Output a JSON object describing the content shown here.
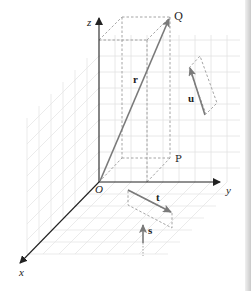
{
  "diagram": {
    "type": "3d-vector-diagram",
    "axes": {
      "x": {
        "label": "x"
      },
      "y": {
        "label": "y"
      },
      "z": {
        "label": "z"
      }
    },
    "origin": {
      "label": "O"
    },
    "points": [
      {
        "id": "P",
        "label": "P"
      },
      {
        "id": "Q",
        "label": "Q"
      }
    ],
    "vectors": [
      {
        "id": "r",
        "label": "r",
        "from": "O",
        "to": "Q"
      },
      {
        "id": "u",
        "label": "u"
      },
      {
        "id": "t",
        "label": "t"
      },
      {
        "id": "s",
        "label": "s"
      }
    ],
    "colors": {
      "axis": "#222222",
      "vector": "#7a7a7a",
      "grid": "#dcdcdc",
      "dashed": "#9a9a9a"
    }
  }
}
